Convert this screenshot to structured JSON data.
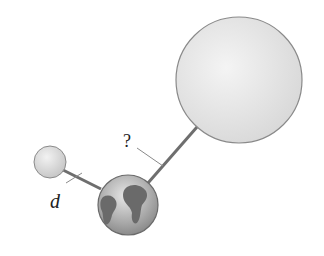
{
  "diagram": {
    "labels": {
      "distance_known": "d",
      "distance_unknown": "?"
    },
    "bodies": [
      {
        "name": "small-moon",
        "cx": 50,
        "cy": 162,
        "r": 16,
        "color": "#d8d8d8"
      },
      {
        "name": "earth",
        "cx": 128,
        "cy": 205,
        "r": 30,
        "color": "#9a9a9a"
      },
      {
        "name": "large-body",
        "cx": 239,
        "cy": 80,
        "r": 63,
        "color": "#e2e2e2"
      }
    ],
    "colors": {
      "connector": "#6e6e6e",
      "outline": "#8a8a8a",
      "continents": "#6a6a6a"
    }
  }
}
